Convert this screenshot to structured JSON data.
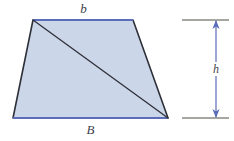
{
  "figure": {
    "type": "geometry-diagram",
    "shape": "trapezoid",
    "labels": {
      "top_base": "b",
      "bottom_base": "B",
      "height": "h"
    },
    "colors": {
      "fill": "#ccd6e9",
      "base_edge": "#5b6cb8",
      "leg_edge": "#2e3038",
      "diagonal": "#2e3038",
      "dimension_arrow": "#5b6cb8",
      "dimension_tick": "#8a8a82",
      "label_text": "#3b3f4a",
      "background": "#ffffff"
    },
    "geometry": {
      "top_left": [
        33,
        20
      ],
      "top_right": [
        133,
        20
      ],
      "bottom_right": [
        168,
        118
      ],
      "bottom_left": [
        13,
        118
      ],
      "diagonal_from": [
        33,
        20
      ],
      "diagonal_to": [
        168,
        118
      ],
      "height_arrow_x": 216,
      "height_top_y": 20,
      "height_bottom_y": 118,
      "tick_x_start": 182,
      "tick_x_end": 229
    }
  }
}
